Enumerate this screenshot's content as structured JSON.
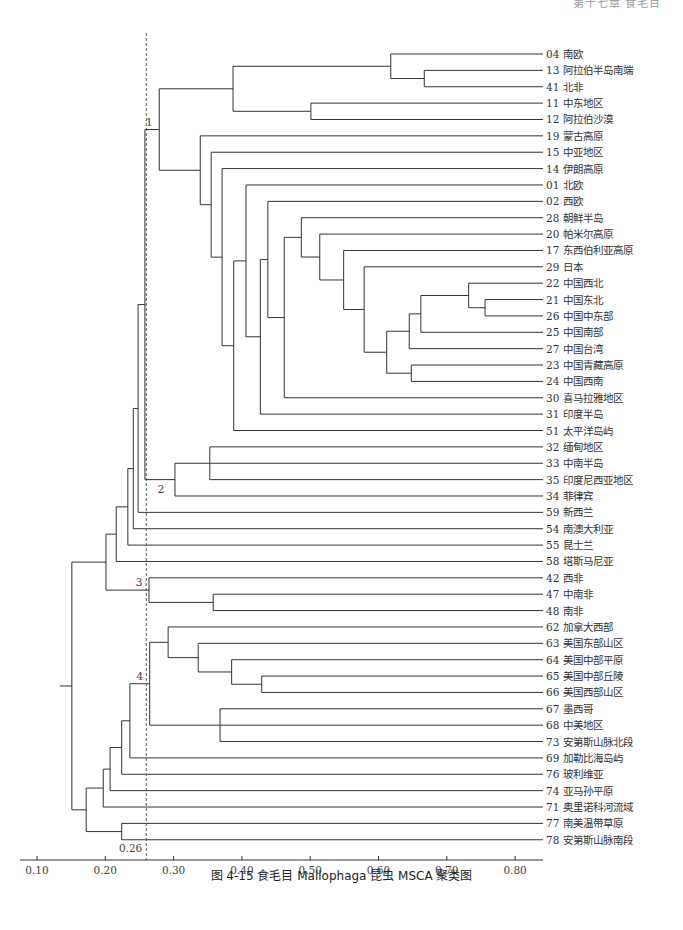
{
  "page_header": "第十七章 食毛目",
  "caption": "图 4-15  食毛目 Mallophaga 昆虫 MSCA 聚类图",
  "colors": {
    "line": "#333333",
    "dash": "#555555",
    "text": "#333333"
  },
  "chart_data": {
    "type": "dendrogram",
    "title": "食毛目 Mallophaga 昆虫 MSCA 聚类图",
    "xlabel": "",
    "x_ticks": [
      0.1,
      0.2,
      0.3,
      0.4,
      0.5,
      0.6,
      0.7,
      0.8
    ],
    "x_tick_labels": [
      "0.10",
      "0.20",
      "0.30",
      "0.40",
      "0.50",
      "0.60",
      "0.70",
      "0.80"
    ],
    "xlim": [
      0.1,
      0.84
    ],
    "threshold": {
      "value": 0.26,
      "label": "0.26"
    },
    "leaves": [
      {
        "id": "04",
        "name": "南欧"
      },
      {
        "id": "13",
        "name": "阿拉伯半岛南端"
      },
      {
        "id": "41",
        "name": "北非"
      },
      {
        "id": "11",
        "name": "中东地区"
      },
      {
        "id": "12",
        "name": "阿拉伯沙漠"
      },
      {
        "id": "19",
        "name": "蒙古高原"
      },
      {
        "id": "15",
        "name": "中亚地区"
      },
      {
        "id": "14",
        "name": "伊朗高原"
      },
      {
        "id": "01",
        "name": "北欧"
      },
      {
        "id": "02",
        "name": "西欧"
      },
      {
        "id": "28",
        "name": "朝鲜半岛"
      },
      {
        "id": "20",
        "name": "帕米尔高原"
      },
      {
        "id": "17",
        "name": "东西伯利亚高原"
      },
      {
        "id": "29",
        "name": "日本"
      },
      {
        "id": "22",
        "name": "中国西北"
      },
      {
        "id": "21",
        "name": "中国东北"
      },
      {
        "id": "26",
        "name": "中国中东部"
      },
      {
        "id": "25",
        "name": "中国南部"
      },
      {
        "id": "27",
        "name": "中国台湾"
      },
      {
        "id": "23",
        "name": "中国青藏高原"
      },
      {
        "id": "24",
        "name": "中国西南"
      },
      {
        "id": "30",
        "name": "喜马拉雅地区"
      },
      {
        "id": "31",
        "name": "印度半岛"
      },
      {
        "id": "51",
        "name": "太平洋岛屿"
      },
      {
        "id": "32",
        "name": "缅甸地区"
      },
      {
        "id": "33",
        "name": "中南半岛"
      },
      {
        "id": "35",
        "name": "印度尼西亚地区"
      },
      {
        "id": "34",
        "name": "菲律宾"
      },
      {
        "id": "59",
        "name": "新西兰"
      },
      {
        "id": "54",
        "name": "南澳大利亚"
      },
      {
        "id": "55",
        "name": "昆士兰"
      },
      {
        "id": "58",
        "name": "塔斯马尼亚"
      },
      {
        "id": "42",
        "name": "西非"
      },
      {
        "id": "47",
        "name": "中南非"
      },
      {
        "id": "48",
        "name": "南非"
      },
      {
        "id": "62",
        "name": "加拿大西部"
      },
      {
        "id": "63",
        "name": "美国东部山区"
      },
      {
        "id": "64",
        "name": "美国中部平原"
      },
      {
        "id": "65",
        "name": "美国中部丘陵"
      },
      {
        "id": "66",
        "name": "美国西部山区"
      },
      {
        "id": "67",
        "name": "墨西哥"
      },
      {
        "id": "68",
        "name": "中美地区"
      },
      {
        "id": "73",
        "name": "安第斯山脉北段"
      },
      {
        "id": "69",
        "name": "加勒比海岛屿"
      },
      {
        "id": "76",
        "name": "玻利维亚"
      },
      {
        "id": "74",
        "name": "亚马孙平原"
      },
      {
        "id": "71",
        "name": "奥里诺科河流域"
      },
      {
        "id": "77",
        "name": "南美温带草原"
      },
      {
        "id": "78",
        "name": "安第斯山脉南段"
      }
    ],
    "tree": {
      "h": 0.151,
      "c": [
        {
          "h": 0.201,
          "c": [
            {
              "h": 0.216,
              "c": [
                {
                  "h": 0.233,
                  "c": [
                    {
                      "h": 0.241,
                      "c": [
                        {
                          "h": 0.248,
                          "c": [
                            {
                              "h": 0.258,
                              "c": [
                                {
                                  "h": 0.279,
                                  "label": "1",
                                  "c": [
                                    {
                                      "h": 0.387,
                                      "c": [
                                        {
                                          "h": 0.618,
                                          "c": [
                                            "04",
                                            {
                                              "h": 0.667,
                                              "c": [
                                                "13",
                                                "41"
                                              ]
                                            }
                                          ]
                                        },
                                        {
                                          "h": 0.501,
                                          "c": [
                                            "11",
                                            "12"
                                          ]
                                        }
                                      ]
                                    },
                                    {
                                      "h": 0.339,
                                      "c": [
                                        "19",
                                        {
                                          "h": 0.355,
                                          "c": [
                                            "15",
                                            {
                                              "h": 0.371,
                                              "c": [
                                                "14",
                                                {
                                                  "h": 0.388,
                                                  "c": [
                                                    {
                                                      "h": 0.406,
                                                      "c": [
                                                        "01",
                                                        {
                                                          "h": 0.427,
                                                          "c": [
                                                            {
                                                              "h": 0.438,
                                                              "c": [
                                                                "02",
                                                                {
                                                                  "h": 0.462,
                                                                  "c": [
                                                                    {
                                                                      "h": 0.487,
                                                                      "c": [
                                                                        "28",
                                                                        {
                                                                          "h": 0.514,
                                                                          "c": [
                                                                            "20",
                                                                            {
                                                                              "h": 0.549,
                                                                              "c": [
                                                                                "17",
                                                                                {
                                                                                  "h": 0.579,
                                                                                  "c": [
                                                                                    "29",
                                                                                    {
                                                                                      "h": 0.612,
                                                                                      "c": [
                                                                                        {
                                                                                          "h": 0.645,
                                                                                          "c": [
                                                                                            {
                                                                                              "h": 0.662,
                                                                                              "c": [
                                                                                                {
                                                                                                  "h": 0.732,
                                                                                                  "c": [
                                                                                                    "22",
                                                                                                    {
                                                                                                      "h": 0.756,
                                                                                                      "c": [
                                                                                                        "21",
                                                                                                        "26"
                                                                                                      ]
                                                                                                    }
                                                                                                  ]
                                                                                                },
                                                                                                "25"
                                                                                              ]
                                                                                            },
                                                                                            "27"
                                                                                          ]
                                                                                        },
                                                                                        {
                                                                                          "h": 0.648,
                                                                                          "c": [
                                                                                            "23",
                                                                                            "24"
                                                                                          ]
                                                                                        }
                                                                                      ]
                                                                                    }
                                                                                  ]
                                                                                }
                                                                              ]
                                                                            }
                                                                          ]
                                                                        }
                                                                      ]
                                                                    },
                                                                    "30"
                                                                  ]
                                                                }
                                                              ]
                                                            },
                                                            "31"
                                                          ]
                                                        }
                                                      ]
                                                    },
                                                    "51"
                                                  ]
                                                }
                                              ]
                                            }
                                          ]
                                        }
                                      ]
                                    }
                                  ]
                                },
                                {
                                  "h": 0.302,
                                  "label": "2",
                                  "c": [
                                    {
                                      "h": 0.353,
                                      "c": [
                                        "32",
                                        "33",
                                        "35"
                                      ]
                                    },
                                    "34"
                                  ]
                                }
                              ]
                            },
                            "59"
                          ]
                        },
                        "54"
                      ]
                    },
                    "55"
                  ]
                },
                "58"
              ]
            },
            {
              "h": 0.264,
              "label": "3",
              "c": [
                "42",
                {
                  "h": 0.358,
                  "c": [
                    "47",
                    "48"
                  ]
                }
              ]
            }
          ]
        },
        {
          "h": 0.172,
          "c": [
            {
              "h": 0.197,
              "c": [
                {
                  "h": 0.207,
                  "c": [
                    {
                      "h": 0.224,
                      "c": [
                        {
                          "h": 0.236,
                          "c": [
                            {
                              "h": 0.265,
                              "label": "4",
                              "c": [
                                {
                                  "h": 0.292,
                                  "c": [
                                    "62",
                                    {
                                      "h": 0.336,
                                      "c": [
                                        "63",
                                        {
                                          "h": 0.385,
                                          "c": [
                                            "64",
                                            {
                                              "h": 0.429,
                                              "c": [
                                                "65",
                                                "66"
                                              ]
                                            }
                                          ]
                                        }
                                      ]
                                    }
                                  ]
                                },
                                {
                                  "h": 0.368,
                                  "c": [
                                    "67",
                                    "68",
                                    "73"
                                  ]
                                }
                              ]
                            },
                            "69"
                          ]
                        },
                        "76"
                      ]
                    },
                    "74"
                  ]
                },
                "71"
              ]
            },
            {
              "h": 0.224,
              "c": [
                "77",
                "78"
              ]
            }
          ]
        }
      ]
    }
  }
}
